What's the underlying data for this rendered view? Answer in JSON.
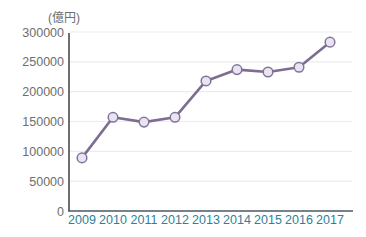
{
  "chart_data": {
    "type": "line",
    "title": "",
    "unit_label": "(億円)",
    "xlabel": "",
    "ylabel": "",
    "categories": [
      "2009",
      "2010",
      "2011",
      "2012",
      "2013",
      "2014",
      "2015",
      "2016",
      "2017"
    ],
    "series": [
      {
        "name": "amount",
        "values": [
          89000,
          157000,
          149000,
          157000,
          218000,
          237000,
          233000,
          241000,
          283000
        ]
      }
    ],
    "ylim": [
      0,
      300000
    ],
    "ytick_step": 50000,
    "yticks": [
      0,
      50000,
      100000,
      150000,
      200000,
      250000,
      300000
    ],
    "grid": "horizontal",
    "legend": "none",
    "colors": {
      "line": "#7d6d90",
      "marker_fill": "#e8e4f1",
      "marker_stroke": "#83739a",
      "gridline": "#ebebf1",
      "y_axis": "#4b4b4b",
      "x_axis": "#4a5963",
      "y_tick_label": "#6e6e6e",
      "x_tick_label": "#2e7f99",
      "unit_label": "#6e6e6e",
      "background": "#ffffff"
    }
  }
}
